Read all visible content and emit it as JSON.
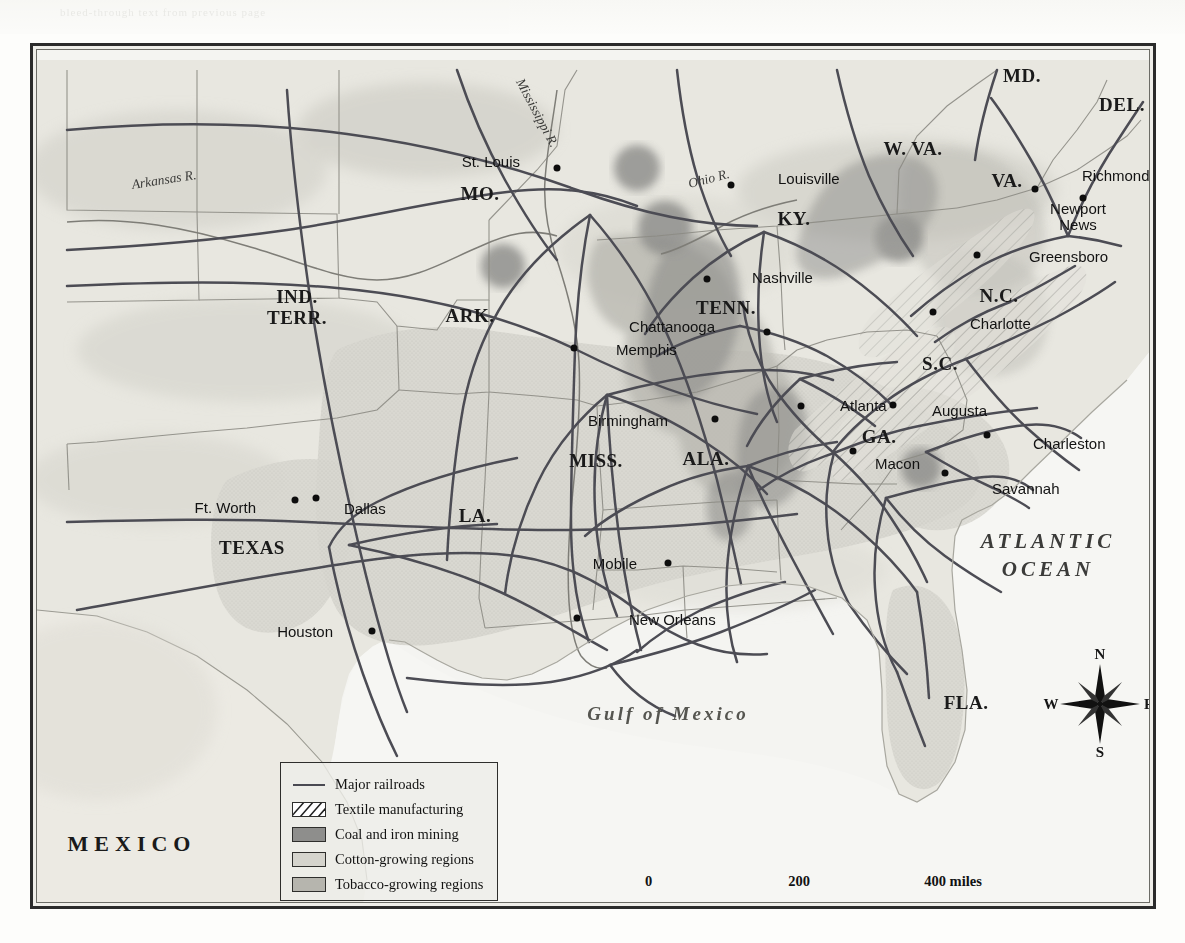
{
  "map": {
    "title_bleed": "bleed-through text from previous page",
    "frame_color": "#2b2b2b",
    "land_color": "#e6e5de",
    "ocean_color": "#f6f6f3",
    "rail_color": "#4a4a52"
  },
  "states": [
    {
      "name": "MD.",
      "x": 1018,
      "y": 73,
      "size": "normal"
    },
    {
      "name": "DEL.",
      "x": 1118,
      "y": 102,
      "size": "normal"
    },
    {
      "name": "W. VA.",
      "x": 909,
      "y": 146,
      "size": "normal"
    },
    {
      "name": "VA.",
      "x": 1003,
      "y": 178,
      "size": "normal"
    },
    {
      "name": "MO.",
      "x": 476,
      "y": 191,
      "size": "normal"
    },
    {
      "name": "KY.",
      "x": 790,
      "y": 216,
      "size": "normal"
    },
    {
      "name": "N.C.",
      "x": 995,
      "y": 293,
      "size": "normal"
    },
    {
      "name": "IND.",
      "x": 293,
      "y": 292,
      "size": "normal"
    },
    {
      "name": "TERR.",
      "x": 293,
      "y": 317,
      "size": "normal"
    },
    {
      "name": "ARK.",
      "x": 466,
      "y": 313,
      "size": "normal"
    },
    {
      "name": "TENN.",
      "x": 722,
      "y": 305,
      "size": "normal"
    },
    {
      "name": "S.C.",
      "x": 936,
      "y": 361,
      "size": "normal"
    },
    {
      "name": "GA.",
      "x": 875,
      "y": 434,
      "size": "normal"
    },
    {
      "name": "MISS.",
      "x": 592,
      "y": 458,
      "size": "normal"
    },
    {
      "name": "ALA.",
      "x": 702,
      "y": 456,
      "size": "normal"
    },
    {
      "name": "LA.",
      "x": 471,
      "y": 513,
      "size": "normal"
    },
    {
      "name": "TEXAS",
      "x": 248,
      "y": 545,
      "size": "normal"
    },
    {
      "name": "FLA.",
      "x": 962,
      "y": 700,
      "size": "normal"
    }
  ],
  "ind_terr": {
    "line1": "IND.",
    "line2": "TERR.",
    "x": 293,
    "y": 304
  },
  "cities": [
    {
      "name": "St. Louis",
      "dot_x": 553,
      "dot_y": 165,
      "lx": 516,
      "ly": 158,
      "anchor": "right"
    },
    {
      "name": "Louisville",
      "dot_x": 727,
      "dot_y": 182,
      "lx": 774,
      "ly": 175,
      "anchor": "left"
    },
    {
      "name": "Richmond",
      "dot_x": 1031,
      "dot_y": 186,
      "lx": 1078,
      "ly": 172,
      "anchor": "left"
    },
    {
      "name": "Newport News",
      "dot_x": 1079,
      "dot_y": 195,
      "lx": 1074,
      "ly": 214,
      "anchor": "two"
    },
    {
      "name": "Greensboro",
      "dot_x": 973,
      "dot_y": 252,
      "lx": 1025,
      "ly": 253,
      "anchor": "left"
    },
    {
      "name": "Nashville",
      "dot_x": 703,
      "dot_y": 276,
      "lx": 748,
      "ly": 274,
      "anchor": "left"
    },
    {
      "name": "Charlotte",
      "dot_x": 929,
      "dot_y": 309,
      "lx": 966,
      "ly": 320,
      "anchor": "left"
    },
    {
      "name": "Chattanooga",
      "dot_x": 763,
      "dot_y": 329,
      "lx": 711,
      "ly": 323,
      "anchor": "right"
    },
    {
      "name": "Memphis",
      "dot_x": 570,
      "dot_y": 345,
      "lx": 612,
      "ly": 346,
      "anchor": "left"
    },
    {
      "name": "Atlanta",
      "dot_x": 797,
      "dot_y": 403,
      "lx": 836,
      "ly": 402,
      "anchor": "left"
    },
    {
      "name": "Augusta",
      "dot_x": 889,
      "dot_y": 402,
      "lx": 928,
      "ly": 407,
      "anchor": "left"
    },
    {
      "name": "Birmingham",
      "dot_x": 711,
      "dot_y": 416,
      "lx": 664,
      "ly": 417,
      "anchor": "right"
    },
    {
      "name": "Charleston",
      "dot_x": 983,
      "dot_y": 432,
      "lx": 1029,
      "ly": 440,
      "anchor": "left"
    },
    {
      "name": "Macon",
      "dot_x": 849,
      "dot_y": 448,
      "lx": 871,
      "ly": 460,
      "anchor": "left"
    },
    {
      "name": "Savannah",
      "dot_x": 941,
      "dot_y": 470,
      "lx": 988,
      "ly": 485,
      "anchor": "left"
    },
    {
      "name": "Ft. Worth",
      "dot_x": 291,
      "dot_y": 497,
      "lx": 252,
      "ly": 504,
      "anchor": "right"
    },
    {
      "name": "Dallas",
      "dot_x": 312,
      "dot_y": 495,
      "lx": 340,
      "ly": 505,
      "anchor": "left"
    },
    {
      "name": "Mobile",
      "dot_x": 664,
      "dot_y": 560,
      "lx": 633,
      "ly": 560,
      "anchor": "right"
    },
    {
      "name": "New Orleans",
      "dot_x": 573,
      "dot_y": 615,
      "lx": 625,
      "ly": 616,
      "anchor": "left"
    },
    {
      "name": "Houston",
      "dot_x": 368,
      "dot_y": 628,
      "lx": 329,
      "ly": 628,
      "anchor": "right"
    }
  ],
  "rivers": [
    {
      "name": "Arkansas R.",
      "x": 160,
      "y": 177,
      "rotate": -9
    },
    {
      "name": "Mississippi R.",
      "x": 533,
      "y": 110,
      "rotate": 62
    },
    {
      "name": "Ohio R.",
      "x": 705,
      "y": 176,
      "rotate": -14
    }
  ],
  "water_labels": {
    "atlantic_line1": "ATLANTIC",
    "atlantic_line2": "OCEAN",
    "atlantic_x": 1044,
    "atlantic_y": 552,
    "gulf": "Gulf of Mexico",
    "gulf_x": 664,
    "gulf_y": 711,
    "mexico": "MEXICO",
    "mexico_x": 128,
    "mexico_y": 841
  },
  "legend": {
    "items": [
      {
        "label": "Major railroads",
        "swatch": "line",
        "color": "#4a4a52"
      },
      {
        "label": "Textile manufacturing",
        "swatch": "hatch",
        "color": "#ffffff"
      },
      {
        "label": "Coal and iron mining",
        "swatch": "coal",
        "color": "#8e8e8c"
      },
      {
        "label": "Cotton-growing regions",
        "swatch": "cotton",
        "color": "#d5d4cd"
      },
      {
        "label": "Tobacco-growing regions",
        "swatch": "tobacco",
        "color": "#b6b5ae"
      }
    ]
  },
  "scale": {
    "miles": {
      "ticks": [
        "0",
        "200",
        "400 miles"
      ],
      "positions": [
        0,
        50,
        100
      ]
    },
    "kilometers": {
      "ticks": [
        "0",
        "200",
        "400 kilometers"
      ],
      "positions": [
        0,
        31,
        62
      ]
    }
  },
  "compass": {
    "north": "N",
    "east": "E",
    "south": "S",
    "west": "W"
  }
}
